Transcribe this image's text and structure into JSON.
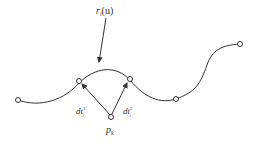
{
  "diagram": {
    "curve_label": "r",
    "curve_label_sub": "i",
    "curve_label_arg": "(u)",
    "point_label": "p",
    "point_label_sub": "k",
    "vector1_label": "dt",
    "vector1_sub": "i",
    "vector1_sup": "1",
    "vector2_label": "dt",
    "vector2_sub": "i",
    "vector2_sup": "2",
    "stroke_color": "#333333",
    "background_color": "#ffffff"
  }
}
